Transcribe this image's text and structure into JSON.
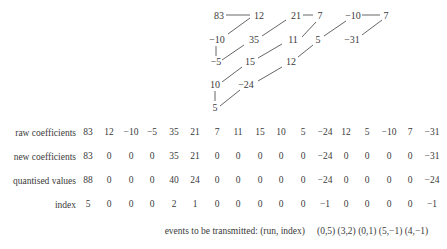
{
  "diagram": {
    "nodes": [
      {
        "label": "83",
        "x": 219,
        "y": 16
      },
      {
        "label": "12",
        "x": 259,
        "y": 16
      },
      {
        "label": "21",
        "x": 296,
        "y": 16
      },
      {
        "label": "7",
        "x": 320,
        "y": 16
      },
      {
        "label": "−10",
        "x": 353,
        "y": 16
      },
      {
        "label": "7",
        "x": 386,
        "y": 16
      },
      {
        "label": "−10",
        "x": 217,
        "y": 40
      },
      {
        "label": "35",
        "x": 254,
        "y": 40
      },
      {
        "label": "11",
        "x": 293,
        "y": 40
      },
      {
        "label": "5",
        "x": 318,
        "y": 40
      },
      {
        "label": "−31",
        "x": 352,
        "y": 40
      },
      {
        "label": "−5",
        "x": 216,
        "y": 62
      },
      {
        "label": "15",
        "x": 250,
        "y": 62
      },
      {
        "label": "12",
        "x": 291,
        "y": 62
      },
      {
        "label": "10",
        "x": 215,
        "y": 85
      },
      {
        "label": "−24",
        "x": 246,
        "y": 85
      },
      {
        "label": "5",
        "x": 215,
        "y": 108
      }
    ],
    "edges": [
      [
        226,
        15,
        250,
        15
      ],
      [
        250,
        18,
        228,
        34
      ],
      [
        216,
        46,
        216,
        56
      ],
      [
        222,
        60,
        244,
        45
      ],
      [
        262,
        36,
        286,
        20
      ],
      [
        222,
        82,
        242,
        67
      ],
      [
        258,
        58,
        282,
        44
      ],
      [
        302,
        37,
        316,
        22
      ],
      [
        303,
        15,
        313,
        15
      ],
      [
        215,
        91,
        215,
        101
      ],
      [
        220,
        106,
        240,
        90
      ],
      [
        258,
        81,
        282,
        67
      ],
      [
        298,
        57,
        313,
        45
      ],
      [
        324,
        36,
        346,
        21
      ],
      [
        362,
        15,
        380,
        15
      ],
      [
        382,
        20,
        362,
        35
      ]
    ]
  },
  "table": {
    "columns_x": [
      88,
      109,
      131,
      152,
      174,
      195,
      217,
      238,
      260,
      281,
      303,
      325,
      346,
      367,
      389,
      410,
      432
    ],
    "rows": [
      {
        "label": "raw coefficients",
        "y": 133,
        "values": [
          "83",
          "12",
          "−10",
          "−5",
          "35",
          "21",
          "7",
          "11",
          "15",
          "10",
          "5",
          "−24",
          "12",
          "5",
          "−10",
          "7",
          "−31"
        ]
      },
      {
        "label": "new coefficients",
        "y": 157,
        "values": [
          "83",
          "0",
          "0",
          "0",
          "35",
          "21",
          "0",
          "0",
          "0",
          "0",
          "0",
          "−24",
          "0",
          "0",
          "0",
          "0",
          "−31"
        ]
      },
      {
        "label": "quantised values",
        "y": 181,
        "values": [
          "88",
          "0",
          "0",
          "0",
          "40",
          "24",
          "0",
          "0",
          "0",
          "0",
          "0",
          "−24",
          "0",
          "0",
          "0",
          "0",
          "−24"
        ]
      },
      {
        "label": "index",
        "y": 205,
        "values": [
          "5",
          "0",
          "0",
          "0",
          "2",
          "1",
          "0",
          "0",
          "0",
          "0",
          "0",
          "−1",
          "0",
          "0",
          "0",
          "0",
          "−1"
        ]
      }
    ]
  },
  "events": {
    "label": "events to be transmitted: (run, index)",
    "values": "(0,5) (3,2) (0,1) (5,−1) (4,−1)"
  }
}
